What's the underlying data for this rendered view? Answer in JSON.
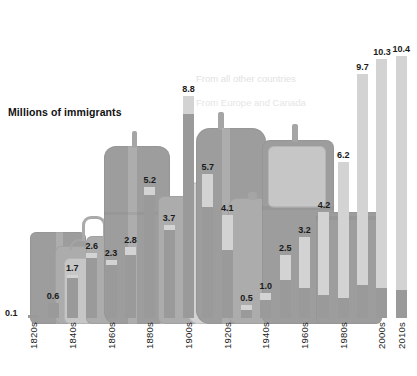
{
  "axis_title": "Millions of immigrants",
  "legend": {
    "other_label": "From all other countries",
    "europe_label": "From Europe and Canada"
  },
  "colors": {
    "other_countries": "#d3d3d3",
    "europe_canada": "#9a9a9a",
    "text": "#1a1a1a",
    "background": "#ffffff"
  },
  "chart_data": {
    "type": "bar",
    "title": "Millions of immigrants",
    "xlabel": "",
    "ylabel": "Millions of immigrants",
    "ylim": [
      0,
      10.4
    ],
    "grid": false,
    "legend_position": "inside-upper-center",
    "stacked": true,
    "categories": [
      "1820s",
      "1830s",
      "1840s",
      "1850s",
      "1860s",
      "1870s",
      "1880s",
      "1890s",
      "1900s",
      "1910s",
      "1920s",
      "1930s",
      "1940s",
      "1950s",
      "1960s",
      "1970s",
      "1980s",
      "1990s",
      "2000s",
      "2010s"
    ],
    "tick_labels": [
      "1820s",
      "",
      "1840s",
      "",
      "1860s",
      "",
      "1880s",
      "",
      "1900s",
      "",
      "1920s",
      "",
      "1940s",
      "",
      "1960s",
      "",
      "1980s",
      "",
      "2000s",
      "2010s"
    ],
    "values": [
      0.1,
      0.6,
      1.7,
      2.6,
      2.3,
      2.8,
      5.2,
      3.7,
      8.8,
      5.7,
      4.1,
      0.5,
      1.0,
      2.5,
      3.2,
      4.2,
      6.2,
      9.7,
      10.3,
      10.4
    ],
    "value_labels": [
      "0.1",
      "0.6",
      "1.7",
      "2.6",
      "2.3",
      "2.8",
      "5.2",
      "3.7",
      "8.8",
      "5.7",
      "4.1",
      "0.5",
      "1.0",
      "2.5",
      "3.2",
      "4.2",
      "6.2",
      "9.7",
      "10.3",
      "10.4"
    ],
    "series": [
      {
        "name": "From Europe and Canada",
        "color": "#9a9a9a",
        "values": [
          0.1,
          0.6,
          1.6,
          2.4,
          2.1,
          2.5,
          4.9,
          3.5,
          8.1,
          4.4,
          2.7,
          0.3,
          0.7,
          1.5,
          1.2,
          0.9,
          0.8,
          1.3,
          1.2,
          1.1
        ]
      },
      {
        "name": "From all other countries",
        "color": "#d3d3d3",
        "values": [
          0.0,
          0.0,
          0.1,
          0.2,
          0.2,
          0.3,
          0.3,
          0.2,
          0.7,
          1.3,
          1.4,
          0.2,
          0.3,
          1.0,
          2.0,
          3.3,
          5.4,
          8.4,
          9.1,
          9.3
        ]
      }
    ]
  }
}
